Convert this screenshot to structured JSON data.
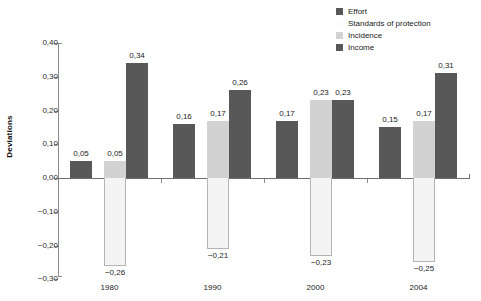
{
  "chart_data": {
    "type": "bar",
    "title": "",
    "subtitle": "",
    "xlabel": "",
    "ylabel": "Deviations",
    "categories": [
      "1980",
      "1990",
      "2000",
      "2004"
    ],
    "ylim": [
      -0.3,
      0.4
    ],
    "ytick_values": [
      0.4,
      0.3,
      0.2,
      0.1,
      0.0,
      -0.1,
      -0.2,
      -0.3
    ],
    "ytick_labels": [
      "0,40",
      "0,30",
      "0,20",
      "0,10",
      "0,00",
      "-0,10",
      "-0,20",
      "-0,30"
    ],
    "decimal_separator": ",",
    "grid": false,
    "legend_position": "top-right",
    "series": [
      {
        "name": "Effort",
        "color": "#585858",
        "values": [
          0.05,
          0.16,
          0.17,
          0.15
        ],
        "labels": [
          "0,05",
          "0,16",
          "0,17",
          "0,15"
        ]
      },
      {
        "name": "Standards of protection",
        "color": "#f4f4f4",
        "values": [
          -0.26,
          -0.21,
          -0.23,
          -0.25
        ],
        "labels": [
          "-0,26",
          "-0,21",
          "-0,23",
          "-0,25"
        ]
      },
      {
        "name": "Incidence",
        "color": "#d2d2d2",
        "values": [
          0.05,
          0.17,
          0.23,
          0.17
        ],
        "labels": [
          "0,05",
          "0,17",
          "0,23",
          "0,17"
        ]
      },
      {
        "name": "Income",
        "color": "#585858",
        "values": [
          0.34,
          0.26,
          0.23,
          0.31
        ],
        "labels": [
          "0,34",
          "0,26",
          "0,23",
          "0,31"
        ]
      }
    ]
  },
  "legend": {
    "items": [
      {
        "label": "Effort",
        "color": "#585858"
      },
      {
        "label": "Standards of protection",
        "color": "#fdfdfd"
      },
      {
        "label": "Incidence",
        "color": "#d2d2d2"
      },
      {
        "label": "Income",
        "color": "#585858"
      }
    ]
  },
  "axis": {
    "y_title": "Deviations"
  }
}
